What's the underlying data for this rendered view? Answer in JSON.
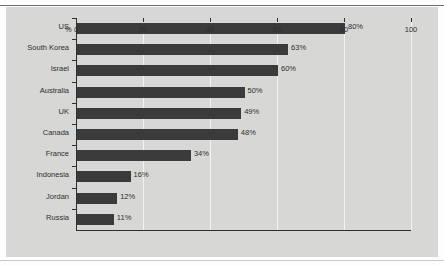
{
  "figure": {
    "background_color": "#d7d7d5",
    "bar_color": "#3b3b3b",
    "gridline_color": "#f3f3f1",
    "axis_color": "#2f2f2f",
    "top_cut_text": "",
    "percent_marker": "%"
  },
  "chart_data": {
    "type": "bar",
    "orientation": "horizontal",
    "title": "",
    "subtitle": "",
    "xlabel": "%",
    "ylabel": "",
    "categories": [
      "US",
      "South Korea",
      "Israel",
      "Australia",
      "UK",
      "Canada",
      "France",
      "Indonesia",
      "Jordan",
      "Russia"
    ],
    "values": [
      80,
      63,
      60,
      50,
      49,
      48,
      34,
      16,
      12,
      11
    ],
    "data_labels": [
      "80%",
      "63%",
      "60%",
      "50%",
      "49%",
      "48%",
      "34%",
      "16%",
      "12%",
      "11%"
    ],
    "xlim": [
      0,
      100
    ],
    "xticks": [
      0,
      20,
      40,
      60,
      80,
      100
    ],
    "xtick_labels": [
      "0",
      "20",
      "40",
      "60",
      "80",
      "100"
    ],
    "grid": true,
    "grid_axis": "x",
    "legend": false,
    "legend_position": "none"
  }
}
